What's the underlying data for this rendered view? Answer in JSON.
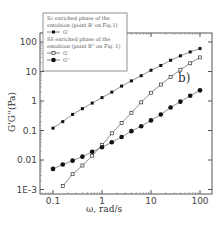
{
  "chart_data": {
    "type": "line",
    "title": "",
    "panel_label": "b)",
    "xlabel": "ω, rad/s",
    "ylabel": "G'G''(Pa)",
    "xscale": "log",
    "yscale": "log",
    "xlim": [
      0.06,
      140
    ],
    "ylim": [
      0.001,
      200
    ],
    "x_ticks": [
      "0.1",
      "1",
      "10",
      "100"
    ],
    "y_ticks": [
      "1E-3",
      "0.01",
      "0.1",
      "1",
      "10",
      "100"
    ],
    "grid": false,
    "legend_position": "upper left",
    "legend": [
      {
        "group": "Sc enriched phase of the emulsion (point B' on Fig.1)",
        "entries": [
          {
            "label": "G'",
            "marker": "filled-square"
          }
        ]
      },
      {
        "group": "SS enriched phase of the emulsion (point B'' on Fig. 1)",
        "entries": [
          {
            "label": "G'",
            "marker": "open-square"
          },
          {
            "label": "G''",
            "marker": "filled-circle"
          }
        ]
      }
    ],
    "series": [
      {
        "name": "Sc G'",
        "marker": "filled-square",
        "x": [
          0.1,
          0.158,
          0.251,
          0.398,
          0.631,
          1,
          1.585,
          2.512,
          3.981,
          6.31,
          10,
          15.85,
          25.12,
          39.81,
          63.1,
          100
        ],
        "values": [
          0.12,
          0.2,
          0.35,
          0.55,
          0.85,
          1.3,
          2.0,
          3.2,
          4.8,
          7.2,
          11,
          16,
          24,
          34,
          46,
          60
        ]
      },
      {
        "name": "SS G'",
        "marker": "open-square",
        "x": [
          0.158,
          0.251,
          0.398,
          0.631,
          1,
          1.585,
          2.512,
          3.981,
          6.31,
          10,
          15.85,
          25.12,
          39.81,
          63.1,
          100
        ],
        "values": [
          0.0013,
          0.0033,
          0.0065,
          0.014,
          0.032,
          0.08,
          0.18,
          0.4,
          0.9,
          1.9,
          3.6,
          6.5,
          11.5,
          19,
          30
        ]
      },
      {
        "name": "SS G''",
        "marker": "filled-circle",
        "x": [
          0.1,
          0.158,
          0.251,
          0.398,
          0.631,
          1,
          1.585,
          2.512,
          3.981,
          6.31,
          10,
          15.85,
          25.12,
          39.81,
          63.1,
          100
        ],
        "values": [
          0.005,
          0.007,
          0.0095,
          0.013,
          0.019,
          0.027,
          0.04,
          0.06,
          0.095,
          0.14,
          0.22,
          0.35,
          0.6,
          0.95,
          1.5,
          2.3
        ]
      }
    ]
  },
  "caption_fragment": ""
}
